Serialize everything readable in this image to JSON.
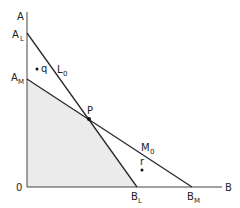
{
  "diagram": {
    "axes": {
      "y_label": "A",
      "x_label": "B",
      "origin_label": "0"
    },
    "points": {
      "A_L": {
        "main": "A",
        "sub": "L"
      },
      "A_M": {
        "main": "A",
        "sub": "M"
      },
      "B_L": {
        "main": "B",
        "sub": "L"
      },
      "B_M": {
        "main": "B",
        "sub": "M"
      },
      "P": "P",
      "q": "q",
      "r": "r"
    },
    "lines": {
      "L0": {
        "main": "L",
        "sub": "0"
      },
      "M0": {
        "main": "M",
        "sub": "0"
      }
    },
    "colors": {
      "line": "#2a2a2a",
      "shade": "#ebebeb"
    }
  }
}
